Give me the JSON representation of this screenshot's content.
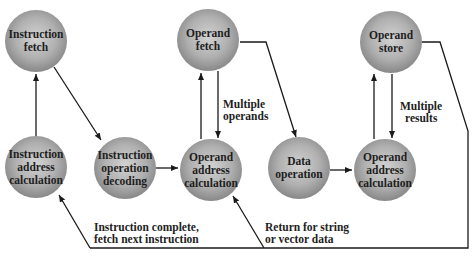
{
  "colors": {
    "node_fill_light": "#c9c9c9",
    "node_fill_dark": "#8a8a8a",
    "edge": "#1a1a1a",
    "text": "#1e1e1e",
    "background": "#ffffff"
  },
  "nodes": [
    {
      "id": "instruction-fetch",
      "lines": [
        "Instruction",
        "fetch"
      ],
      "cx": 36,
      "cy": 41
    },
    {
      "id": "operand-fetch",
      "lines": [
        "Operand",
        "fetch"
      ],
      "cx": 208,
      "cy": 40
    },
    {
      "id": "operand-store",
      "lines": [
        "Operand",
        "store"
      ],
      "cx": 391,
      "cy": 42
    },
    {
      "id": "instruction-address-calculation",
      "lines": [
        "Instruction",
        "address",
        "calculation"
      ],
      "cx": 36,
      "cy": 167
    },
    {
      "id": "instruction-operation-decoding",
      "lines": [
        "Instruction",
        "operation",
        "decoding"
      ],
      "cx": 125,
      "cy": 168
    },
    {
      "id": "operand-address-calculation-1",
      "lines": [
        "Operand",
        "address",
        "calculation"
      ],
      "cx": 211,
      "cy": 170
    },
    {
      "id": "data-operation",
      "lines": [
        "Data",
        "operation"
      ],
      "cx": 299,
      "cy": 168
    },
    {
      "id": "operand-address-calculation-2",
      "lines": [
        "Operand",
        "address",
        "calculation"
      ],
      "cx": 385,
      "cy": 170
    }
  ],
  "edge_labels": {
    "multiple_operands": [
      "Multiple",
      "operands"
    ],
    "multiple_results": [
      "Multiple",
      "results"
    ],
    "instruction_complete": [
      "Instruction complete,",
      "fetch next instruction"
    ],
    "return_string": [
      "Return for string",
      "or vector data"
    ]
  }
}
